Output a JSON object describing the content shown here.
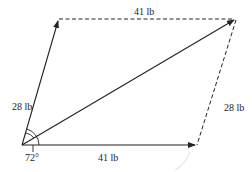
{
  "diagram": {
    "type": "parallelogram-vector-addition",
    "labels": {
      "left_side": "28 lb",
      "top_side": "41 lb",
      "right_side": "28 lb",
      "bottom_side": "41 lb",
      "angle": "72°"
    },
    "vectors": [
      {
        "name": "force-a",
        "magnitude": "28 lb",
        "style": "solid"
      },
      {
        "name": "force-b",
        "magnitude": "41 lb",
        "style": "solid"
      },
      {
        "name": "resultant",
        "style": "solid"
      }
    ],
    "colors": {
      "line": "#222222",
      "arc_highlight": "#e6e6e6"
    }
  }
}
